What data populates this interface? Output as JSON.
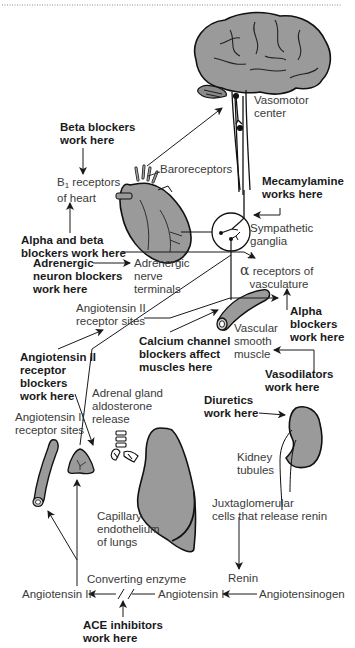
{
  "diagram": {
    "organs": {
      "brain": "brain",
      "heart": "heart",
      "ganglia": "sympathetic ganglia",
      "vessel": "blood vessel",
      "adrenal": "adrenal gland",
      "lung": "lung",
      "kidney": "kidney",
      "vessel2": "blood vessel"
    },
    "labels": {
      "vasomotor": "Vasomotor\ncenter",
      "beta_blockers": "Beta blockers\nwork here",
      "baroreceptors": "Baroreceptors",
      "b1_receptors_prefix": "B",
      "b1_receptors_sub": "1",
      "b1_receptors_rest": " receptors\nof heart",
      "mecamylamine": "Mecamylamine\nworks here",
      "sympathetic": "Sympathetic\nganglia",
      "alpha_beta": "Alpha and beta\nblockers work here",
      "adrenergic_blockers": "Adrenergic\nneuron blockers\nwork here",
      "adrenergic_terminals": "Adrenergic\nnerve\nterminals",
      "alpha_receptors_symbol": "α",
      "alpha_receptors": " receptors of\n   vasculature",
      "angio_receptor_sites_1": "Angiotensin II\nreceptor sites",
      "alpha_blockers": "Alpha\nblockers\nwork here",
      "calcium_blockers": "Calcium channel\nblockers affect\nmuscles here",
      "vascular_muscle": "Vascular\nsmooth\nmuscle",
      "angio_receptor_blockers": "Angiotensin II\nreceptor\nblockers\nwork here",
      "vasodilators": "Vasodilators\nwork here",
      "adrenal_release": "Adrenal gland\naldosterone\nrelease",
      "diuretics": "Diuretics\nwork here",
      "angio_receptor_sites_2": "Angiotensin II\nreceptor sites",
      "kidney_tubules": "Kidney\ntubules",
      "capillary": "Capillary\nendothelium\nof lungs",
      "juxtaglomerular": "Juxtaglomerular\ncells that release renin",
      "renin": "Renin",
      "converting_enzyme": "Converting enzyme",
      "angiotensin_ii": "Angiotensin II",
      "angiotensin_i": "Angiotensin I",
      "angiotensinogen": "Angiotensinogen",
      "ace_inhibitors": "ACE inhibitors\nwork here"
    },
    "colors": {
      "organ_fill": "#9a9a9a",
      "line": "#1a1a1a",
      "text": "#3a3a3a",
      "bold_text": "#1a1a1a"
    }
  }
}
